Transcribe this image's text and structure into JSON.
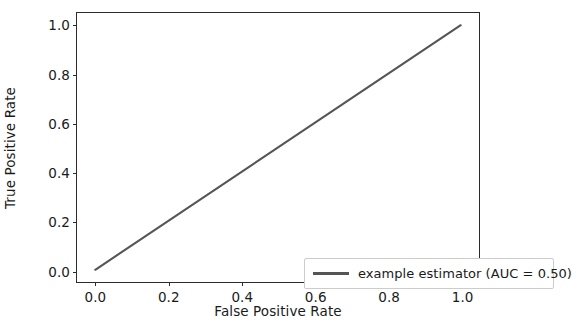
{
  "chart_data": {
    "type": "line",
    "title": "",
    "xlabel": "False Positive Rate",
    "ylabel": "True Positive Rate",
    "xlim": [
      -0.05,
      1.05
    ],
    "ylim": [
      -0.05,
      1.05
    ],
    "grid": false,
    "legend_position": "lower right",
    "xticks": [
      "0.0",
      "0.2",
      "0.4",
      "0.6",
      "0.8",
      "1.0"
    ],
    "xtick_values": [
      0.0,
      0.2,
      0.4,
      0.6,
      0.8,
      1.0
    ],
    "yticks": [
      "0.0",
      "0.2",
      "0.4",
      "0.6",
      "0.8",
      "1.0"
    ],
    "ytick_values": [
      0.0,
      0.2,
      0.4,
      0.6,
      0.8,
      1.0
    ],
    "series": [
      {
        "name": "example estimator (AUC = 0.50)",
        "color": "#555555",
        "linewidth": 2.1,
        "x": [
          0.0,
          1.0
        ],
        "values": [
          0.0,
          1.0
        ]
      }
    ],
    "annotations": {
      "auc": "0.50",
      "estimator_name": "example estimator"
    }
  },
  "legend": {
    "entries": [
      {
        "label": "example estimator (AUC = 0.50)"
      }
    ]
  },
  "colors": {
    "line": "#555555",
    "axis": "#2b2b2b",
    "text": "#1a1a1a",
    "background": "#ffffff",
    "legend_border": "#cccccc"
  }
}
